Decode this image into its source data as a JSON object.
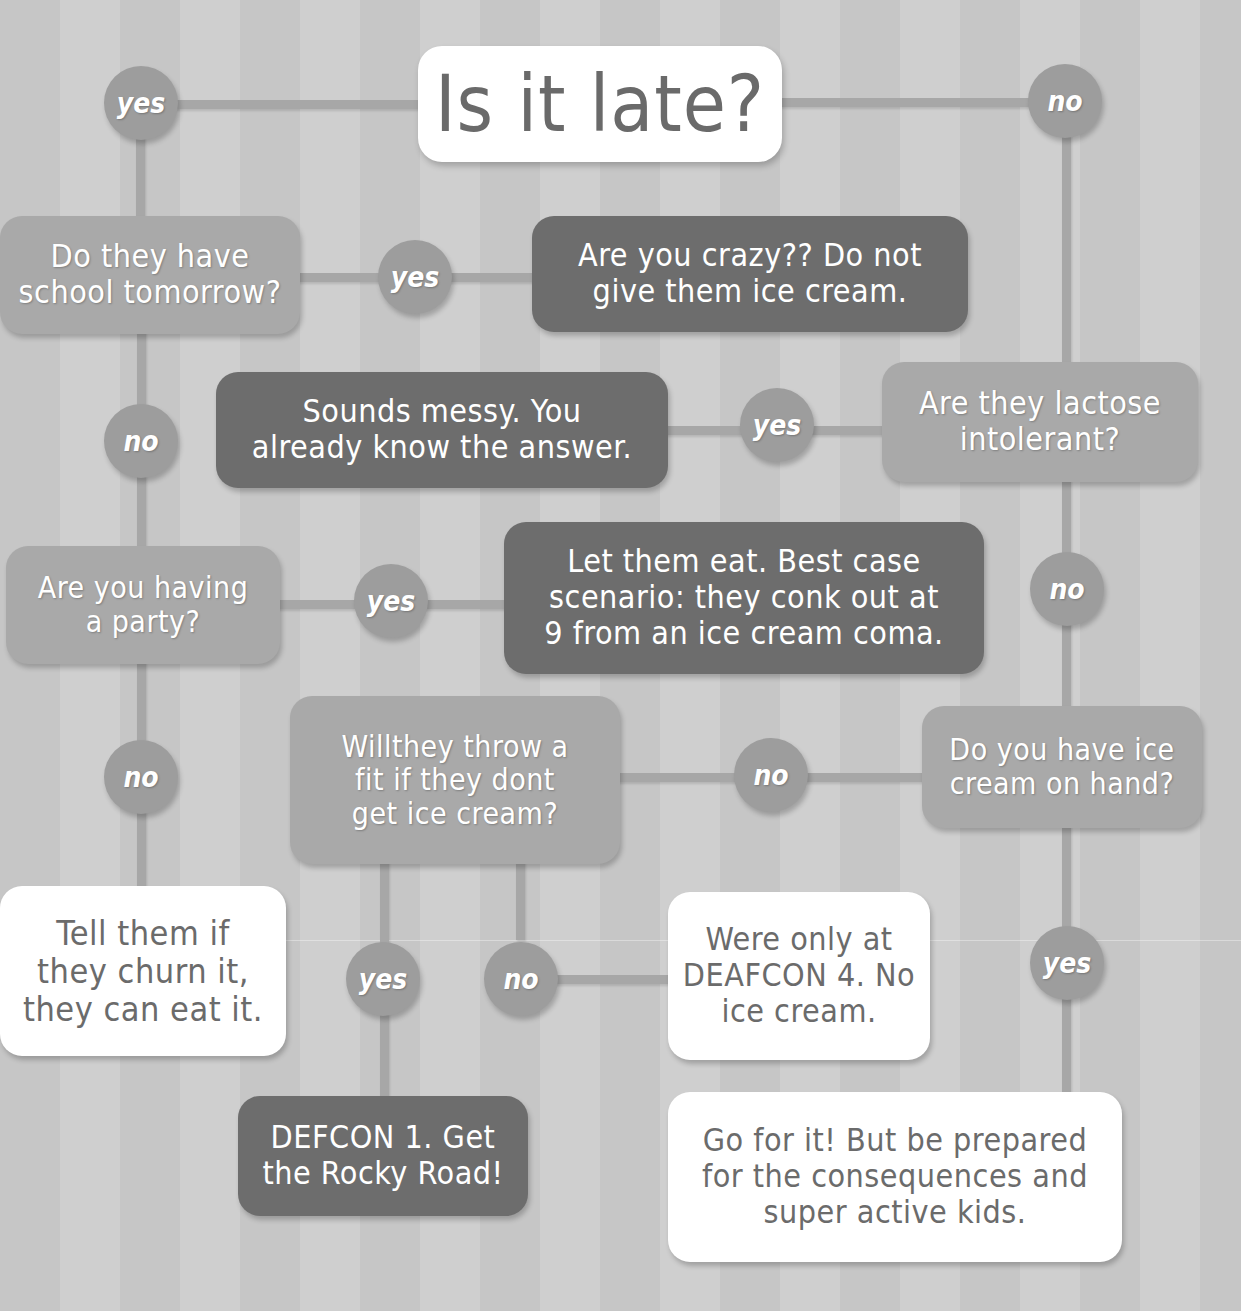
{
  "title": "Is it late?",
  "colors": {
    "background_stripe_a": "#c6c6c6",
    "background_stripe_b": "#cfcfcf",
    "connector": "#a7a7a7",
    "circle": "#9d9d9d",
    "box_white": "#ffffff",
    "box_mid": "#a9a9a9",
    "box_dark": "#6d6d6d",
    "text_dark": "#6b6b6b",
    "text_light": "#ffffff"
  },
  "nodes": {
    "school_tomorrow": "Do they have\nschool tomorrow?",
    "crazy": "Are you crazy?? Do not\ngive them ice cream.",
    "messy": "Sounds messy. You\nalready know the answer.",
    "lactose": "Are they lactose\nintolerant?",
    "party": "Are you having\na party?",
    "let_them_eat": "Let them eat. Best case\nscenario: they conk out at\n9 from an ice cream coma.",
    "throw_fit": "Willthey throw a\nfit if they dont\nget ice cream?",
    "on_hand": "Do you have ice\ncream on hand?",
    "churn": "Tell them if\nthey churn it,\nthey can eat it.",
    "deafcon4": "Were only at\nDEAFCON 4. No\nice cream.",
    "defcon1": "DEFCON 1. Get\nthe Rocky Road!",
    "go_for_it": "Go for it! But be prepared\nfor the consequences and\nsuper active kids."
  },
  "answers": {
    "late_yes": "yes",
    "late_no": "no",
    "school_yes": "yes",
    "school_no": "no",
    "lactose_yes": "yes",
    "lactose_no": "no",
    "party_yes": "yes",
    "party_no": "no",
    "fit_yes": "yes",
    "fit_no": "no",
    "onhand_no": "no",
    "onhand_yes": "yes"
  }
}
